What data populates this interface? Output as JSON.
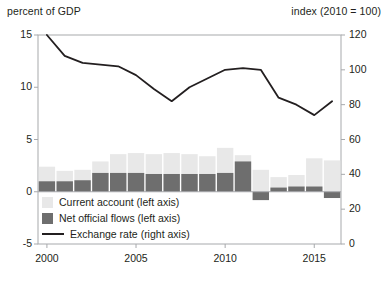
{
  "chart_data": {
    "type": "bar",
    "title": "",
    "subtitle": "",
    "left_axis_label": "percent of GDP",
    "right_axis_label": "index (2010 = 100)",
    "xlabel": "",
    "ylabel": "percent of GDP",
    "grid": false,
    "legend_position": "inside-bottom-left",
    "x": [
      2000,
      2001,
      2002,
      2003,
      2004,
      2005,
      2006,
      2007,
      2008,
      2009,
      2010,
      2011,
      2012,
      2013,
      2014,
      2015,
      2016
    ],
    "xtick_labels": [
      "2000",
      "2005",
      "2010",
      "2015"
    ],
    "xtick_values": [
      2000,
      2005,
      2010,
      2015
    ],
    "ylim_left": [
      -5,
      15
    ],
    "ytick_labels_left": [
      "15",
      "10",
      "5",
      "0",
      "-5"
    ],
    "ytick_values_left": [
      15,
      10,
      5,
      0,
      -5
    ],
    "ylim_right": [
      0,
      120
    ],
    "ytick_labels_right": [
      "120",
      "100",
      "80",
      "60",
      "40",
      "20",
      "0"
    ],
    "ytick_values_right": [
      120,
      100,
      80,
      60,
      40,
      20,
      0
    ],
    "series": [
      {
        "name": "Current account (left axis)",
        "type": "bar",
        "axis": "left",
        "color": "#e8e8e8",
        "values": [
          2.4,
          2.0,
          2.1,
          2.9,
          3.6,
          3.7,
          3.6,
          3.7,
          3.6,
          3.4,
          4.2,
          3.5,
          2.1,
          1.4,
          1.6,
          3.2,
          3.0
        ]
      },
      {
        "name": "Net official flows (left axis)",
        "type": "bar",
        "axis": "left",
        "color": "#6e6e6e",
        "values": [
          1.0,
          1.0,
          1.1,
          1.8,
          1.8,
          1.8,
          1.7,
          1.7,
          1.7,
          1.7,
          1.8,
          2.9,
          -0.8,
          0.4,
          0.5,
          0.5,
          -0.6
        ]
      },
      {
        "name": "Exchange rate (right axis)",
        "type": "line",
        "axis": "right",
        "color": "#231f20",
        "values": [
          120,
          108,
          104,
          103,
          102,
          97,
          89,
          82,
          90,
          95,
          100,
          101,
          100,
          84,
          80,
          74,
          82
        ]
      }
    ],
    "legend": [
      {
        "label": "Current account (left axis)",
        "marker": "swatch",
        "color": "#e8e8e8"
      },
      {
        "label": "Net official flows (left axis)",
        "marker": "swatch",
        "color": "#6e6e6e"
      },
      {
        "label": "Exchange rate (right axis)",
        "marker": "line",
        "color": "#231f20"
      }
    ]
  },
  "colors": {
    "current_account": "#e8e8e8",
    "net_official_flows": "#6e6e6e",
    "exchange_rate": "#231f20",
    "axis": "#a7a9ac",
    "background": "#ffffff"
  }
}
